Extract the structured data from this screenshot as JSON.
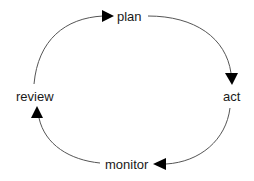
{
  "diagram": {
    "type": "cycle",
    "nodes": [
      {
        "id": "plan",
        "label": "plan"
      },
      {
        "id": "act",
        "label": "act"
      },
      {
        "id": "monitor",
        "label": "monitor"
      },
      {
        "id": "review",
        "label": "review"
      }
    ],
    "edges": [
      {
        "from": "plan",
        "to": "act"
      },
      {
        "from": "act",
        "to": "monitor"
      },
      {
        "from": "monitor",
        "to": "review"
      },
      {
        "from": "review",
        "to": "plan"
      }
    ],
    "colors": {
      "edge": "#555555",
      "arrowhead": "#000000",
      "text": "#1a1a1a"
    }
  }
}
